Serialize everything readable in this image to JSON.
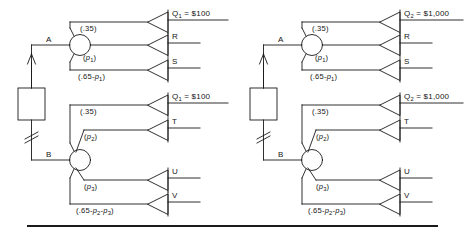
{
  "figure": {
    "type": "decision-tree-diagram",
    "ink_color": "#1a1a1a",
    "background_color": "#ffffff"
  },
  "panels": [
    {
      "id": "left-panel",
      "decision_node": {
        "name": "decision-square",
        "label": ""
      },
      "chance_nodes": [
        {
          "id": "A",
          "label": "A"
        },
        {
          "id": "B",
          "label": "B"
        }
      ],
      "branches": [
        {
          "from": "A",
          "probability": ".35",
          "terminal": "Q1 = $100"
        },
        {
          "from": "A",
          "probability": "p1",
          "terminal": "R"
        },
        {
          "from": "A",
          "probability": ".65-p1",
          "terminal": "S"
        },
        {
          "from": "B",
          "probability": ".35",
          "terminal": "Q1 = $100"
        },
        {
          "from": "B",
          "probability": "p2",
          "terminal": "T"
        },
        {
          "from": "B",
          "probability": "p3",
          "terminal": "U"
        },
        {
          "from": "B",
          "probability": ".65-p2-p3",
          "terminal": "V"
        }
      ],
      "probability_labels": {
        "a_top": ".35",
        "a_mid_pre": "(",
        "a_mid_var": "p",
        "a_mid_sub": "1",
        "a_mid_post": ")",
        "a_bot_pre": "(.65-",
        "a_bot_var": "p",
        "a_bot_sub": "1",
        "a_bot_post": ")",
        "b_top": ".35",
        "b_mid_pre": "(",
        "b_mid_var": "p",
        "b_mid_sub": "2",
        "b_mid_post": ")",
        "b_u_pre": "(",
        "b_u_var": "p",
        "b_u_sub": "3",
        "b_u_post": ")",
        "b_bot_pre": "(.65-",
        "b_bot_var1": "p",
        "b_bot_sub1": "2",
        "b_bot_dash": "-",
        "b_bot_var2": "p",
        "b_bot_sub2": "3",
        "b_bot_post": ")"
      },
      "terminal_labels": {
        "t1_q": "Q",
        "t1_sub": "1",
        "t1_eq": " = ",
        "t1_val": "$100",
        "t2": "R",
        "t3": "S",
        "t4_q": "Q",
        "t4_sub": "1",
        "t4_eq": " = ",
        "t4_val": "$100",
        "t5": "T",
        "t6": "U",
        "t7": "V"
      },
      "node_labels": {
        "a": "A",
        "b": "B"
      },
      "paren_open": "(",
      "paren_close": ")",
      "dot35": "(.35)"
    },
    {
      "id": "right-panel",
      "decision_node": {
        "name": "decision-square",
        "label": ""
      },
      "chance_nodes": [
        {
          "id": "A",
          "label": "A"
        },
        {
          "id": "B",
          "label": "B"
        }
      ],
      "branches": [
        {
          "from": "A",
          "probability": ".35",
          "terminal": "Q2 = $1,000"
        },
        {
          "from": "A",
          "probability": "p1",
          "terminal": "R"
        },
        {
          "from": "A",
          "probability": ".65-p1",
          "terminal": "S"
        },
        {
          "from": "B",
          "probability": ".35",
          "terminal": "Q2 = $1,000"
        },
        {
          "from": "B",
          "probability": "p2",
          "terminal": "T"
        },
        {
          "from": "B",
          "probability": "p3",
          "terminal": "U"
        },
        {
          "from": "B",
          "probability": ".65-p2-p3",
          "terminal": "V"
        }
      ],
      "probability_labels": {
        "a_top": ".35",
        "a_mid_var": "p",
        "a_mid_sub": "1",
        "a_bot_pre": "(.65-",
        "a_bot_var": "p",
        "a_bot_sub": "1",
        "b_top": ".35",
        "b_mid_var": "p",
        "b_mid_sub": "2",
        "b_u_var": "p",
        "b_u_sub": "3",
        "b_bot_pre": "(.65-",
        "b_bot_var1": "p",
        "b_bot_sub1": "2",
        "b_bot_dash": "-",
        "b_bot_var2": "p",
        "b_bot_sub2": "3"
      },
      "terminal_labels": {
        "t1_q": "Q",
        "t1_sub": "2",
        "t1_eq": " = ",
        "t1_val": "$1,000",
        "t2": "R",
        "t3": "S",
        "t4_q": "Q",
        "t4_sub": "2",
        "t4_eq": " = ",
        "t4_val": "$1,000",
        "t5": "T",
        "t6": "U",
        "t7": "V"
      },
      "node_labels": {
        "a": "A",
        "b": "B"
      },
      "dot35": "(.35)"
    }
  ],
  "common": {
    "dot35": "(.35)",
    "paren_open": "(",
    "paren_close": ")",
    "prefix_65": "(.65-",
    "dash": "-",
    "p": "p",
    "eq": "="
  }
}
